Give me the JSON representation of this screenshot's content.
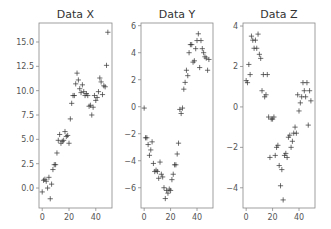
{
  "chart_data": [
    {
      "type": "scatter",
      "title": "Data X",
      "xlabel": "",
      "ylabel": "",
      "marker": "+",
      "color": "#333333",
      "grid": false,
      "xlim": [
        -2.4,
        52.1
      ],
      "ylim": [
        -2.05,
        16.95
      ],
      "xticks": [
        0,
        20,
        40
      ],
      "xticklabels": [
        "0",
        "20",
        "40"
      ],
      "yticks": [
        0.0,
        2.5,
        5.0,
        7.5,
        10.0,
        12.5,
        15.0
      ],
      "yticklabels": [
        "0.0",
        "2.5",
        "5.0",
        "7.5",
        "10.0",
        "12.5",
        "15.0"
      ],
      "x": [
        0,
        1,
        2,
        3,
        4,
        5,
        6,
        7,
        8,
        9,
        10,
        11,
        12,
        13,
        14,
        15,
        16,
        17,
        18,
        19,
        20,
        21,
        22,
        23,
        24,
        25,
        26,
        27,
        28,
        29,
        30,
        31,
        32,
        33,
        34,
        35,
        36,
        37,
        38,
        39,
        40,
        41,
        42,
        43,
        44,
        45,
        46,
        47,
        48,
        49
      ],
      "y": [
        -0.4,
        0.8,
        0.9,
        0.7,
        0.0,
        1.1,
        -1.1,
        0.4,
        1.9,
        2.4,
        2.4,
        3.6,
        4.9,
        5.5,
        4.6,
        4.8,
        4.9,
        5.8,
        5.3,
        5.4,
        4.6,
        7.1,
        8.7,
        9.5,
        9.5,
        10.7,
        11.8,
        11.1,
        10.2,
        9.8,
        10.6,
        9.9,
        9.5,
        9.7,
        9.5,
        8.4,
        8.5,
        7.5,
        8.3,
        9.5,
        9.0,
        9.3,
        9.9,
        11.3,
        10.9,
        9.6,
        10.5,
        10.4,
        12.6,
        16.0
      ]
    },
    {
      "type": "scatter",
      "title": "Data Y",
      "xlabel": "",
      "ylabel": "",
      "marker": "+",
      "color": "#333333",
      "grid": false,
      "xlim": [
        -2.4,
        52.1
      ],
      "ylim": [
        -7.5,
        6.2
      ],
      "xticks": [
        0,
        20,
        40
      ],
      "xticklabels": [
        "0",
        "20",
        "40"
      ],
      "yticks": [
        -6,
        -4,
        -2,
        0,
        2,
        4,
        6
      ],
      "yticklabels": [
        "−6",
        "−4",
        "−2",
        "0",
        "2",
        "4",
        "6"
      ],
      "x": [
        0,
        1,
        2,
        3,
        4,
        5,
        6,
        7,
        8,
        9,
        10,
        11,
        12,
        13,
        14,
        15,
        16,
        17,
        18,
        19,
        20,
        21,
        22,
        23,
        24,
        25,
        26,
        27,
        28,
        29,
        30,
        31,
        32,
        33,
        34,
        35,
        36,
        37,
        38,
        39,
        40,
        41,
        42,
        43,
        44,
        45,
        46,
        47,
        48,
        49
      ],
      "y": [
        -0.1,
        -2.3,
        -2.3,
        -2.8,
        -3.6,
        -3.2,
        -2.6,
        -4.2,
        -4.8,
        -4.7,
        -4.8,
        -5.3,
        -4.1,
        -5.0,
        -5.2,
        -6.0,
        -6.8,
        -6.2,
        -6.4,
        -6.1,
        -6.2,
        -5.4,
        -5.0,
        -4.3,
        -4.3,
        -3.5,
        -2.7,
        -0.2,
        -0.5,
        -0.1,
        1.3,
        1.8,
        2.7,
        2.3,
        4.0,
        4.6,
        4.6,
        3.3,
        3.4,
        4.3,
        4.9,
        5.4,
        2.9,
        4.9,
        4.3,
        4.0,
        3.7,
        3.6,
        2.7,
        3.5
      ]
    },
    {
      "type": "scatter",
      "title": "Data Z",
      "xlabel": "",
      "ylabel": "",
      "marker": "+",
      "color": "#333333",
      "grid": false,
      "xlim": [
        -2.4,
        52.1
      ],
      "ylim": [
        -5.0,
        4.15
      ],
      "xticks": [
        0,
        20,
        40
      ],
      "xticklabels": [
        "0",
        "20",
        "40"
      ],
      "yticks": [
        -4,
        -2,
        0,
        2,
        4
      ],
      "yticklabels": [
        "−4",
        "−2",
        "0",
        "2",
        "4"
      ],
      "x": [
        0,
        1,
        2,
        3,
        4,
        5,
        6,
        7,
        8,
        9,
        10,
        11,
        12,
        13,
        14,
        15,
        16,
        17,
        18,
        19,
        20,
        21,
        22,
        23,
        24,
        25,
        26,
        27,
        28,
        29,
        30,
        31,
        32,
        33,
        34,
        35,
        36,
        37,
        38,
        39,
        40,
        41,
        42,
        43,
        44,
        45,
        46,
        47,
        48,
        49
      ],
      "y": [
        1.3,
        1.2,
        2.1,
        1.6,
        3.5,
        3.3,
        2.9,
        3.3,
        2.9,
        3.6,
        2.6,
        2.4,
        0.8,
        1.6,
        0.5,
        0.6,
        1.6,
        -0.5,
        -2.5,
        -0.6,
        -0.6,
        -0.5,
        -2.4,
        -2.0,
        -1.9,
        -2.9,
        -3.9,
        -3.1,
        -4.6,
        -2.4,
        -2.3,
        -2.5,
        -1.5,
        -1.4,
        -2.0,
        -1.7,
        -1.3,
        -1.0,
        -1.3,
        0.6,
        -0.2,
        0.2,
        0.5,
        1.2,
        0.8,
        0.5,
        1.2,
        -0.9,
        0.8,
        0.3
      ]
    }
  ]
}
